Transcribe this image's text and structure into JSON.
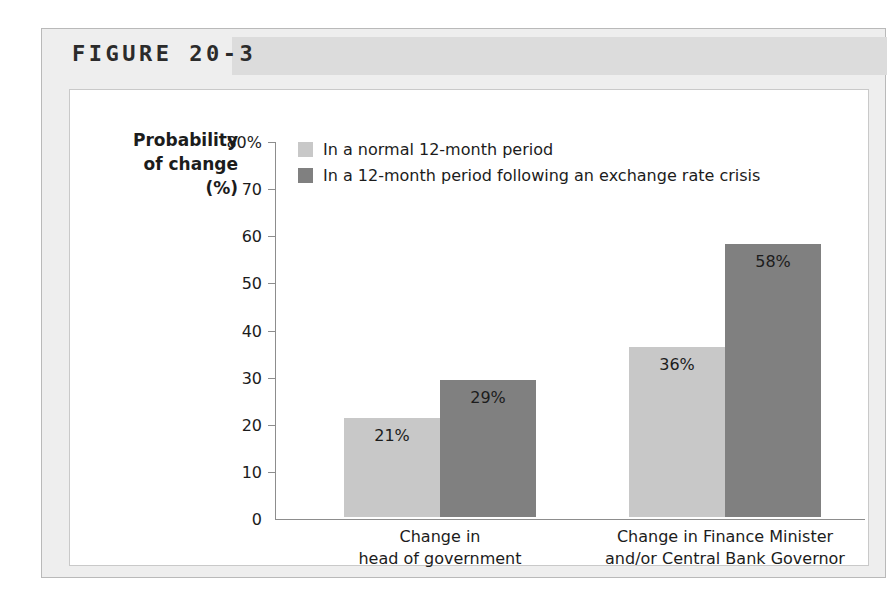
{
  "figure": {
    "title": "FIGURE 20-3"
  },
  "chart_data": {
    "type": "bar",
    "title": "",
    "xlabel": "",
    "ylabel": "Probability of change (%)",
    "ylabel_lines": [
      "Probability",
      "of change",
      "(%)"
    ],
    "ylim": [
      0,
      80
    ],
    "ytick_labels": [
      "80%",
      "70",
      "60",
      "50",
      "40",
      "30",
      "20",
      "10",
      "0"
    ],
    "ytick_values": [
      80,
      70,
      60,
      50,
      40,
      30,
      20,
      10,
      0
    ],
    "grid": false,
    "legend_position": "top-left-inside",
    "categories": [
      "Change in head of government",
      "Change in Finance Minister and/or Central Bank Governor"
    ],
    "category_lines": [
      [
        "Change in",
        "head of government"
      ],
      [
        "Change in Finance Minister",
        "and/or Central Bank Governor"
      ]
    ],
    "series": [
      {
        "name": "In a normal 12-month period",
        "color": "#c8c8c8",
        "values": [
          21,
          36
        ],
        "labels": [
          "21%",
          "36%"
        ]
      },
      {
        "name": "In a 12-month period following an exchange rate crisis",
        "color": "#808080",
        "values": [
          29,
          58
        ],
        "labels": [
          "29%",
          "58%"
        ]
      }
    ]
  },
  "colors": {
    "card_background": "#eeeeee",
    "title_band": "#dcdcdc",
    "panel_background": "#ffffff",
    "axis": "#8d8d8d",
    "text": "#1c1c1c",
    "series_light": "#c8c8c8",
    "series_dark": "#808080"
  }
}
